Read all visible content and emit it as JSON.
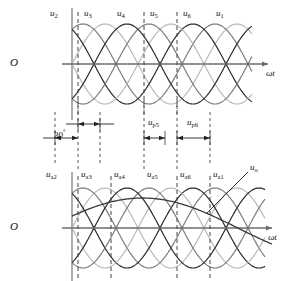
{
  "figure": {
    "title_visible": false,
    "axis_label": "ωt",
    "origin_label": "O",
    "angle_label": "30",
    "angle_unit": "°"
  },
  "top_panel": {
    "origin_label": "O",
    "axis_label": "ωt",
    "curve_labels": [
      {
        "base": "u",
        "sub": "2",
        "x": 50,
        "y": 9
      },
      {
        "base": "u",
        "sub": "3",
        "x": 84,
        "y": 9
      },
      {
        "base": "u",
        "sub": "4",
        "x": 117,
        "y": 9
      },
      {
        "base": "u",
        "sub": "5",
        "x": 150,
        "y": 9
      },
      {
        "base": "u",
        "sub": "6",
        "x": 183,
        "y": 9
      },
      {
        "base": "u",
        "sub": "1",
        "x": 216,
        "y": 9
      }
    ],
    "dashed_x": [
      78,
      144,
      177
    ],
    "axis_y": 64,
    "amplitude": 40,
    "x_start": 72,
    "x_end": 252,
    "period": 132,
    "phase_step_deg": 60
  },
  "middle_panel": {
    "angle_text": "30",
    "angle_unit": "°",
    "dim_labels": [
      {
        "base": "u",
        "sub": "p5",
        "x": 148,
        "y": 118
      },
      {
        "base": "u",
        "sub": "p6",
        "x": 187,
        "y": 118
      }
    ],
    "dim_dashed_x": [
      55,
      78,
      100,
      144,
      177,
      210
    ],
    "upper_arrow_y": 124,
    "lower_arrow_y": 138
  },
  "bottom_panel": {
    "origin_label": "O",
    "axis_label": "ωt",
    "curve_labels": [
      {
        "base": "u",
        "sub": "a2",
        "x": 48,
        "y": 170
      },
      {
        "base": "u",
        "sub": "a3",
        "x": 81,
        "y": 170
      },
      {
        "base": "u",
        "sub": "a4",
        "x": 114,
        "y": 170
      },
      {
        "base": "u",
        "sub": "a5",
        "x": 147,
        "y": 170
      },
      {
        "base": "u",
        "sub": "a6",
        "x": 180,
        "y": 170
      },
      {
        "base": "u",
        "sub": "a1",
        "x": 213,
        "y": 170
      }
    ],
    "output_label": {
      "base": "u",
      "sub": "o",
      "x": 248,
      "y": 163
    },
    "dashed_x": [
      78,
      111,
      177,
      210
    ],
    "axis_y": 228,
    "amplitude": 40,
    "x_start": 72,
    "x_end": 265,
    "period": 132,
    "phase_step_deg": 60
  },
  "chart_data": {
    "type": "line",
    "title": "",
    "xlabel": "ωt",
    "ylabel": "",
    "grid": false,
    "legend": "inline-labels",
    "panels": [
      {
        "name": "upper",
        "description": "Six-phase secondary voltages u1..u6, sinusoids spaced 60 degrees apart",
        "series": [
          {
            "name": "u₂",
            "phase_deg": 0,
            "amplitude": 1.0,
            "color": "#b9b9b9"
          },
          {
            "name": "u₃",
            "phase_deg": 60,
            "amplitude": 1.0,
            "color": "#7d7d7d"
          },
          {
            "name": "u₄",
            "phase_deg": 120,
            "amplitude": 1.0,
            "color": "#2b2b2b"
          },
          {
            "name": "u₅",
            "phase_deg": 180,
            "amplitude": 1.0,
            "color": "#b9b9b9"
          },
          {
            "name": "u₆",
            "phase_deg": 240,
            "amplitude": 1.0,
            "color": "#7d7d7d"
          },
          {
            "name": "u₁",
            "phase_deg": 300,
            "amplitude": 1.0,
            "color": "#2b2b2b"
          }
        ],
        "markers": {
          "dashed_vertical_at_deg": [
            30,
            210,
            300
          ]
        }
      },
      {
        "name": "lower",
        "description": "Phase-shifted voltages u_a1..u_a6 plus output u_o",
        "series": [
          {
            "name": "uₐ₂",
            "phase_deg": 0,
            "amplitude": 1.0,
            "color": "#b9b9b9"
          },
          {
            "name": "uₐ₃",
            "phase_deg": 60,
            "amplitude": 1.0,
            "color": "#7d7d7d"
          },
          {
            "name": "uₐ₄",
            "phase_deg": 120,
            "amplitude": 1.0,
            "color": "#2b2b2b"
          },
          {
            "name": "uₐ₅",
            "phase_deg": 180,
            "amplitude": 1.0,
            "color": "#b9b9b9"
          },
          {
            "name": "uₐ₆",
            "phase_deg": 240,
            "amplitude": 1.0,
            "color": "#7d7d7d"
          },
          {
            "name": "uₐ₁",
            "phase_deg": 300,
            "amplitude": 1.0,
            "color": "#2b2b2b"
          },
          {
            "name": "uₒ",
            "phase_deg": 15,
            "amplitude": 0.55,
            "color": "#3a3a3a"
          }
        ],
        "markers": {
          "dashed_vertical_at_deg": [
            30,
            120,
            300,
            360
          ]
        }
      }
    ],
    "annotations": [
      {
        "text": "30°",
        "type": "dimension",
        "panel": "middle"
      },
      {
        "text": "u_p5",
        "type": "dimension",
        "panel": "middle"
      },
      {
        "text": "u_p6",
        "type": "dimension",
        "panel": "middle"
      }
    ]
  },
  "colors": {
    "curve_dark": "#2b2b2b",
    "curve_mid": "#7d7d7d",
    "curve_light": "#bfbfbf",
    "axis": "#6b6b6b",
    "dashed": "#444444",
    "text": "#111111"
  }
}
